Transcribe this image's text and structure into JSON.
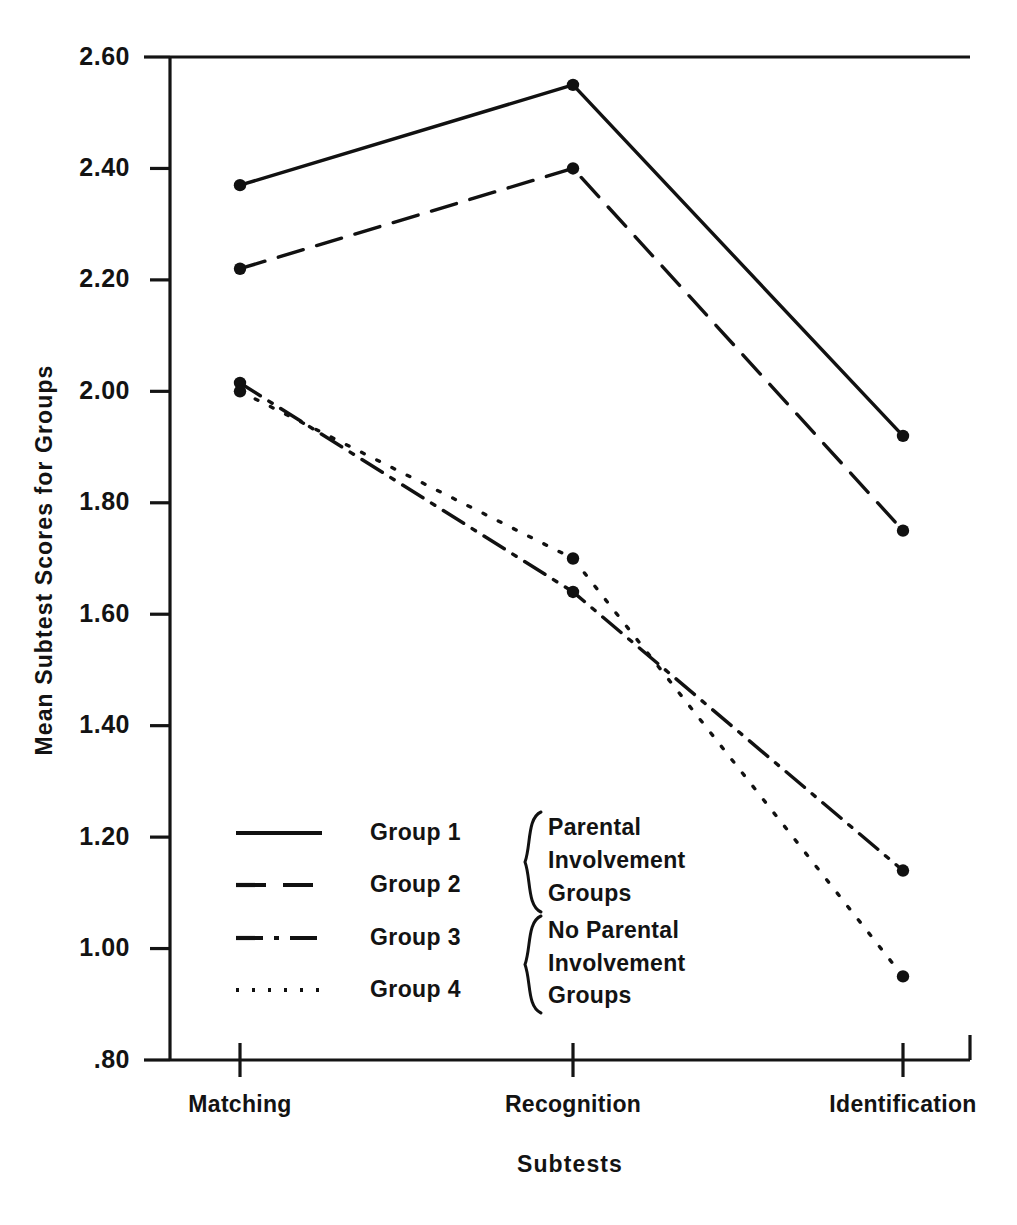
{
  "chart_data": {
    "type": "line",
    "title": "",
    "xlabel": "Subtests",
    "ylabel": "Mean Subtest Scores for Groups",
    "categories": [
      "Matching",
      "Recognition",
      "Identification"
    ],
    "ylim": [
      0.8,
      2.6
    ],
    "ytick_labels": [
      ".80",
      "1.00",
      "1.20",
      "1.40",
      "1.60",
      "1.80",
      "2.00",
      "2.20",
      "2.40",
      "2.60"
    ],
    "ytick_values": [
      0.8,
      1.0,
      1.2,
      1.4,
      1.6,
      1.8,
      2.0,
      2.2,
      2.4,
      2.6
    ],
    "grid": false,
    "legend_position": "inside-lower-left",
    "series": [
      {
        "name": "Group 1",
        "style": "solid",
        "dash": "none",
        "values": [
          2.37,
          2.55,
          1.92
        ]
      },
      {
        "name": "Group 2",
        "style": "dashed",
        "dash": "26 14",
        "values": [
          2.22,
          2.4,
          1.75
        ]
      },
      {
        "name": "Group 3",
        "style": "dashdot",
        "dash": "24 10 4 10",
        "values": [
          2.015,
          1.64,
          1.14
        ]
      },
      {
        "name": "Group 4",
        "style": "dotted",
        "dash": "3 14",
        "values": [
          2.0,
          1.7,
          0.95
        ]
      }
    ]
  },
  "legend": {
    "entries": [
      {
        "label": "Group  1",
        "style": "solid"
      },
      {
        "label": "Group  2",
        "style": "dashed"
      },
      {
        "label": "Group  3",
        "style": "dashdot"
      },
      {
        "label": "Group  4",
        "style": "dotted"
      }
    ],
    "brace_groups": [
      {
        "lines": [
          "Parental",
          "Involvement",
          "Groups"
        ]
      },
      {
        "lines": [
          "No  Parental",
          "Involvement",
          "Groups"
        ]
      }
    ]
  },
  "axis": {
    "y_title": "Mean Subtest Scores for Groups",
    "x_title": "Subtests",
    "y_labels": [
      {
        "text": "2.60",
        "value": 2.6
      },
      {
        "text": "2.40",
        "value": 2.4
      },
      {
        "text": "2.20",
        "value": 2.2
      },
      {
        "text": "2.00",
        "value": 2.0
      },
      {
        "text": "1.80",
        "value": 1.8
      },
      {
        "text": "1.60",
        "value": 1.6
      },
      {
        "text": "1.40",
        "value": 1.4
      },
      {
        "text": "1.20",
        "value": 1.2
      },
      {
        "text": "1.00",
        "value": 1.0
      },
      {
        "text": ".80",
        "value": 0.8
      }
    ],
    "x_labels": [
      {
        "text": "Matching"
      },
      {
        "text": "Recognition"
      },
      {
        "text": "Identification"
      }
    ]
  }
}
